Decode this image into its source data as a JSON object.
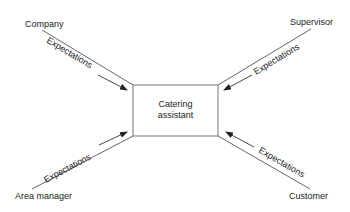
{
  "diagram": {
    "center": {
      "line1": "Catering",
      "line2": "assistant"
    },
    "nodes": {
      "company": "Company",
      "supervisor": "Supervisor",
      "area_manager": "Area manager",
      "customer": "Customer"
    },
    "edge_label": "Expectations",
    "edges": [
      {
        "from": "Company",
        "to": "Catering assistant",
        "label": "Expectations"
      },
      {
        "from": "Supervisor",
        "to": "Catering assistant",
        "label": "Expectations"
      },
      {
        "from": "Area manager",
        "to": "Catering assistant",
        "label": "Expectations"
      },
      {
        "from": "Customer",
        "to": "Catering assistant",
        "label": "Expectations"
      }
    ],
    "colors": {
      "line": "#555555",
      "text": "#222222",
      "box": "#777777"
    }
  }
}
